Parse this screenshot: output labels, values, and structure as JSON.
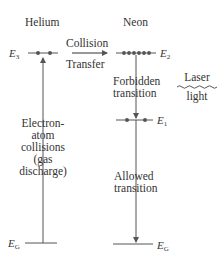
{
  "diagram": {
    "columns": {
      "helium": {
        "title": "Helium"
      },
      "neon": {
        "title": "Neon"
      }
    },
    "levels": {
      "he_E3": {
        "symbol": "E",
        "subscript": "3",
        "electrons": 2
      },
      "he_EG": {
        "symbol": "E",
        "subscript": "G"
      },
      "ne_E2": {
        "symbol": "E",
        "subscript": "2",
        "electrons": 6
      },
      "ne_E1": {
        "symbol": "E",
        "subscript": "1",
        "electrons": 2
      },
      "ne_EG": {
        "symbol": "E",
        "subscript": "G"
      }
    },
    "labels": {
      "collision_line1": "Collision",
      "collision_line2": "Transfer",
      "electron_atom": [
        "Electron-",
        "atom",
        "collisions",
        "(gas",
        "discharge)"
      ],
      "forbidden": [
        "Forbidden",
        "transition"
      ],
      "allowed": [
        "Allowed",
        "transition"
      ],
      "laser": [
        "Laser",
        "light"
      ]
    },
    "colors": {
      "line": "#555555",
      "dot": "#555555",
      "text": "#333333"
    }
  }
}
